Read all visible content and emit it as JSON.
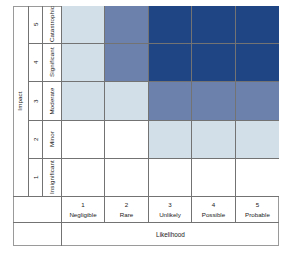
{
  "chart_data": {
    "type": "heatmap",
    "title": "",
    "xlabel": "Likelihood",
    "ylabel": "Impact",
    "x_categories": [
      "Negligible",
      "Rare",
      "Unlikely",
      "Possible",
      "Probable"
    ],
    "x_levels": [
      "1",
      "2",
      "3",
      "4",
      "5"
    ],
    "y_categories": [
      "Insignificant",
      "Minor",
      "Moderate",
      "Significant",
      "Catastrophic"
    ],
    "y_levels": [
      "1",
      "2",
      "3",
      "4",
      "5"
    ],
    "grid": true,
    "legend": "none",
    "colors": {
      "none": "#ffffff",
      "low": "#d2dfe9",
      "medium": "#6c82ac",
      "high": "#1f4584",
      "gridline": "#737373",
      "frame": "#9a9a9a",
      "text": "#1a1a1a"
    },
    "rows_top_to_bottom": [
      {
        "impact_level": "5",
        "impact_label": "Catastrophic",
        "cells": [
          "low",
          "medium",
          "high",
          "high",
          "high"
        ]
      },
      {
        "impact_level": "4",
        "impact_label": "Significant",
        "cells": [
          "low",
          "medium",
          "high",
          "high",
          "high"
        ]
      },
      {
        "impact_level": "3",
        "impact_label": "Moderate",
        "cells": [
          "low",
          "low",
          "medium",
          "medium",
          "medium"
        ]
      },
      {
        "impact_level": "2",
        "impact_label": "Minor",
        "cells": [
          "none",
          "none",
          "low",
          "low",
          "low"
        ]
      },
      {
        "impact_level": "1",
        "impact_label": "Insignificant",
        "cells": [
          "none",
          "none",
          "none",
          "none",
          "none"
        ]
      }
    ]
  },
  "axes": {
    "impact_title": "Impact",
    "likelihood_title": "Likelihood"
  },
  "impact_rows": [
    {
      "level": "5",
      "label": "Catastrophic"
    },
    {
      "level": "4",
      "label": "Significant"
    },
    {
      "level": "3",
      "label": "Moderate"
    },
    {
      "level": "2",
      "label": "Minor"
    },
    {
      "level": "1",
      "label": "Insignificant"
    }
  ],
  "likelihood_cols": [
    {
      "level": "1",
      "label": "Negligible"
    },
    {
      "level": "2",
      "label": "Rare"
    },
    {
      "level": "3",
      "label": "Unlikely"
    },
    {
      "level": "4",
      "label": "Possible"
    },
    {
      "level": "5",
      "label": "Probable"
    }
  ]
}
